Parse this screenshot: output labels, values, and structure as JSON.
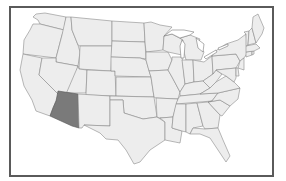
{
  "map": {
    "title": "United States",
    "highlighted_state": "Arizona",
    "colors": {
      "frame_border": "#5a5a5a",
      "state_fill": "#ededed",
      "state_border": "#8a8a8a",
      "highlight_fill": "#7a7a7a",
      "background": "#ffffff"
    },
    "states": [
      {
        "name": "Washington"
      },
      {
        "name": "Oregon"
      },
      {
        "name": "California"
      },
      {
        "name": "Idaho"
      },
      {
        "name": "Nevada"
      },
      {
        "name": "Montana"
      },
      {
        "name": "Wyoming"
      },
      {
        "name": "Utah"
      },
      {
        "name": "Arizona",
        "highlighted": true
      },
      {
        "name": "Colorado"
      },
      {
        "name": "New Mexico"
      },
      {
        "name": "North Dakota"
      },
      {
        "name": "South Dakota"
      },
      {
        "name": "Nebraska"
      },
      {
        "name": "Kansas"
      },
      {
        "name": "Oklahoma"
      },
      {
        "name": "Texas"
      },
      {
        "name": "Minnesota"
      },
      {
        "name": "Iowa"
      },
      {
        "name": "Missouri"
      },
      {
        "name": "Arkansas"
      },
      {
        "name": "Louisiana"
      },
      {
        "name": "Wisconsin"
      },
      {
        "name": "Illinois"
      },
      {
        "name": "Michigan"
      },
      {
        "name": "Indiana"
      },
      {
        "name": "Ohio"
      },
      {
        "name": "Kentucky"
      },
      {
        "name": "Tennessee"
      },
      {
        "name": "Mississippi"
      },
      {
        "name": "Alabama"
      },
      {
        "name": "Georgia"
      },
      {
        "name": "Florida"
      },
      {
        "name": "South Carolina"
      },
      {
        "name": "North Carolina"
      },
      {
        "name": "Virginia"
      },
      {
        "name": "West Virginia"
      },
      {
        "name": "Pennsylvania"
      },
      {
        "name": "New York"
      },
      {
        "name": "Maryland"
      },
      {
        "name": "Delaware"
      },
      {
        "name": "New Jersey"
      },
      {
        "name": "Connecticut"
      },
      {
        "name": "Rhode Island"
      },
      {
        "name": "Massachusetts"
      },
      {
        "name": "Vermont"
      },
      {
        "name": "New Hampshire"
      },
      {
        "name": "Maine"
      }
    ]
  }
}
